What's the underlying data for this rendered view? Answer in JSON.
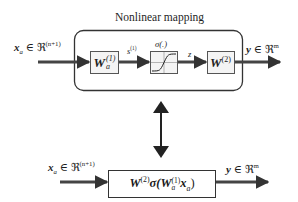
{
  "top_diagram": {
    "title": "Nonlinear mapping",
    "input_label": {
      "var": "x",
      "sub": "a",
      "rel": " ∈ ℜ",
      "sup": "(n+1)"
    },
    "output_label": {
      "var": "y",
      "rel": " ∈ ℜ",
      "sup": "m"
    },
    "block1": {
      "main": "W",
      "sup": "(1)",
      "sub": "a"
    },
    "signal1": {
      "main": "s",
      "sup": "(1)"
    },
    "activation": {
      "label": "σ(.)"
    },
    "signal2": {
      "main": "z"
    },
    "block2": {
      "main": "W",
      "sup": "(2)"
    }
  },
  "equivalence_arrow": {
    "icon": "double-headed-vertical-arrow"
  },
  "bottom_diagram": {
    "input_label": {
      "var": "x",
      "sub": "a",
      "rel": " ∈ ℜ",
      "sup": "(n+1)"
    },
    "output_label": {
      "var": "y",
      "rel": " ∈ ℜ",
      "sup": "m"
    },
    "block": {
      "w2": "W",
      "w2_sup": "(2)",
      "sigma": "σ(",
      "w1": "W",
      "w1_sup": "(1)",
      "w1_sub": "a",
      "x": "x",
      "x_sub": "a",
      "close": ")"
    }
  },
  "colors": {
    "line": "#333333",
    "block_fill": "#f4f4f4",
    "block_border": "#555555"
  }
}
